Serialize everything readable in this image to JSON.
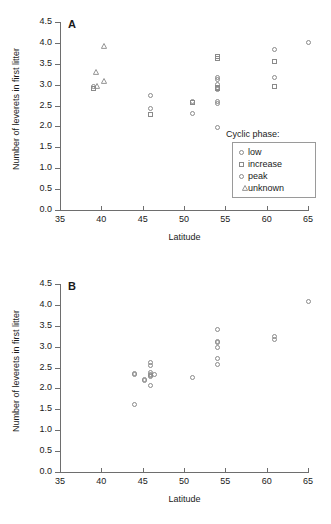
{
  "figure": {
    "panels": [
      {
        "id": "A",
        "label": "A",
        "axis": {
          "xlabel": "Latitude",
          "ylabel": "Number of leverets in first litter",
          "xticks": [
            "35",
            "40",
            "45",
            "50",
            "55",
            "60",
            "65"
          ],
          "yticks": [
            "0.0",
            "0.5",
            "1.0",
            "1.5",
            "2.0",
            "2.5",
            "3.0",
            "3.5",
            "4.0",
            "4.5"
          ],
          "xlim": [
            35,
            65
          ],
          "ylim": [
            0.0,
            4.5
          ]
        },
        "legend": {
          "title": "Cyclic phase:",
          "items": [
            {
              "label": "low",
              "marker": "circle"
            },
            {
              "label": "increase",
              "marker": "square"
            },
            {
              "label": "peak",
              "marker": "circle"
            },
            {
              "label": "unknown",
              "marker": "triangle"
            }
          ]
        }
      },
      {
        "id": "B",
        "label": "B",
        "axis": {
          "xlabel": "Latitude",
          "ylabel": "Number of leverets in first litter",
          "xticks": [
            "35",
            "40",
            "45",
            "50",
            "55",
            "60",
            "65"
          ],
          "yticks": [
            "0.0",
            "0.5",
            "1.0",
            "1.5",
            "2.0",
            "2.5",
            "3.0",
            "3.5",
            "4.0",
            "4.5"
          ],
          "xlim": [
            35,
            65
          ],
          "ylim": [
            0.0,
            4.5
          ]
        },
        "legend": {
          "title": "Cyclic phase:",
          "items": [
            {
              "label": "decline",
              "marker": "circle"
            }
          ]
        }
      }
    ]
  },
  "chart_data": [
    {
      "type": "scatter",
      "panel": "A",
      "title": "A",
      "xlabel": "Latitude",
      "ylabel": "Number of leverets in first litter",
      "xlim": [
        35,
        65
      ],
      "ylim": [
        0.0,
        4.5
      ],
      "xticks": [
        35,
        40,
        45,
        50,
        55,
        60,
        65
      ],
      "yticks": [
        0.0,
        0.5,
        1.0,
        1.5,
        2.0,
        2.5,
        3.0,
        3.5,
        4.0,
        4.5
      ],
      "grid": false,
      "legend_position": "right-middle",
      "legend_title": "Cyclic phase:",
      "series": [
        {
          "name": "low",
          "marker": "circle",
          "points": [
            [
              46.0,
              2.42
            ],
            [
              51.0,
              2.3
            ],
            [
              54.0,
              2.6
            ],
            [
              54.0,
              2.55
            ],
            [
              54.0,
              1.97
            ],
            [
              54.0,
              2.88
            ],
            [
              61.0,
              3.85
            ],
            [
              61.0,
              3.17
            ],
            [
              65.0,
              4.0
            ]
          ]
        },
        {
          "name": "increase",
          "marker": "square",
          "points": [
            [
              39.0,
              2.9
            ],
            [
              46.0,
              2.28
            ],
            [
              51.0,
              2.57
            ],
            [
              54.0,
              3.62
            ],
            [
              54.0,
              3.67
            ],
            [
              54.0,
              2.9
            ],
            [
              54.0,
              2.94
            ],
            [
              61.0,
              3.55
            ],
            [
              61.0,
              2.95
            ]
          ]
        },
        {
          "name": "peak",
          "marker": "circle",
          "points": [
            [
              39.0,
              2.96
            ],
            [
              46.0,
              2.74
            ],
            [
              51.0,
              2.59
            ],
            [
              54.0,
              3.17
            ],
            [
              54.0,
              3.13
            ],
            [
              54.0,
              3.0
            ],
            [
              54.0,
              2.9
            ]
          ]
        },
        {
          "name": "unknown",
          "marker": "triangle",
          "points": [
            [
              39.0,
              3.3
            ],
            [
              39.1,
              2.98
            ],
            [
              40.0,
              3.08
            ],
            [
              40.0,
              3.93
            ]
          ]
        }
      ]
    },
    {
      "type": "scatter",
      "panel": "B",
      "title": "B",
      "xlabel": "Latitude",
      "ylabel": "Number of leverets in first litter",
      "xlim": [
        35,
        65
      ],
      "ylim": [
        0.0,
        4.5
      ],
      "xticks": [
        35,
        40,
        45,
        50,
        55,
        60,
        65
      ],
      "yticks": [
        0.0,
        0.5,
        1.0,
        1.5,
        2.0,
        2.5,
        3.0,
        3.5,
        4.0,
        4.5
      ],
      "grid": false,
      "legend_position": "right-lower",
      "legend_title": "Cyclic phase:",
      "series": [
        {
          "name": "decline",
          "marker": "circle",
          "points": [
            [
              44.0,
              2.36
            ],
            [
              44.0,
              2.33
            ],
            [
              44.0,
              1.62
            ],
            [
              45.2,
              2.22
            ],
            [
              45.2,
              2.19
            ],
            [
              46.0,
              2.62
            ],
            [
              46.0,
              2.56
            ],
            [
              46.0,
              2.37
            ],
            [
              46.0,
              2.33
            ],
            [
              46.0,
              2.3
            ],
            [
              46.0,
              2.28
            ],
            [
              46.0,
              2.08
            ],
            [
              46.4,
              2.33
            ],
            [
              51.0,
              2.27
            ],
            [
              54.0,
              3.42
            ],
            [
              54.0,
              3.13
            ],
            [
              54.0,
              3.1
            ],
            [
              54.0,
              2.97
            ],
            [
              54.0,
              2.72
            ],
            [
              54.0,
              2.58
            ],
            [
              61.0,
              3.25
            ],
            [
              61.0,
              3.16
            ],
            [
              65.0,
              4.09
            ]
          ]
        }
      ]
    }
  ]
}
